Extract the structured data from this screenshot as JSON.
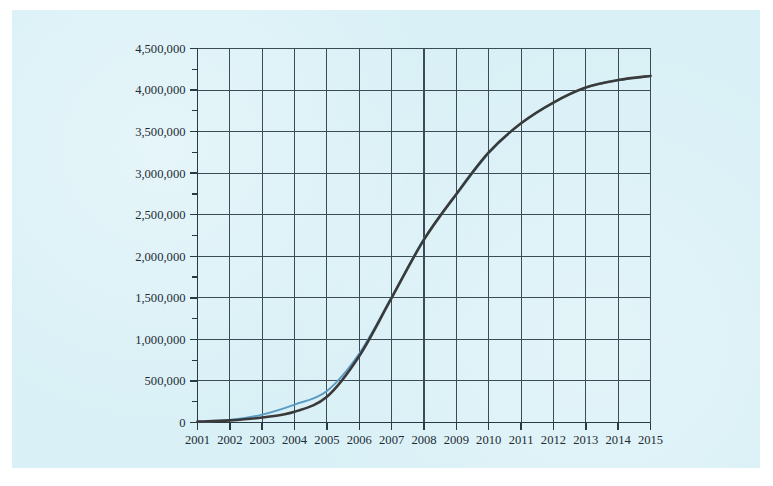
{
  "page": {
    "background_color": "#ffffff",
    "paper_tint_color": "#d8f0f6"
  },
  "chart_data": {
    "type": "line",
    "title": "",
    "subtitle": "",
    "xlabel": "",
    "ylabel": "",
    "xlim": [
      2001,
      2015
    ],
    "ylim": [
      0,
      4500000
    ],
    "grid": true,
    "legend_position": "none",
    "x_tick_labels": [
      "2001",
      "2002",
      "2003",
      "2004",
      "2005",
      "2006",
      "2007",
      "2008",
      "2009",
      "2010",
      "2011",
      "2012",
      "2013",
      "2014",
      "2015"
    ],
    "y_tick_labels": [
      "0",
      "500,000",
      "1,000,000",
      "1,500,000",
      "2,000,000",
      "2,500,000",
      "3,000,000",
      "3,500,000",
      "4,000,000",
      "4,500,000"
    ],
    "y_major_ticks": [
      0,
      500000,
      1000000,
      1500000,
      2000000,
      2500000,
      3000000,
      3500000,
      4000000,
      4500000
    ],
    "y_minor_ticks": [
      250000,
      750000,
      1250000,
      1750000,
      2250000,
      2750000,
      3250000,
      3750000,
      4250000
    ],
    "x": [
      2001,
      2002,
      2003,
      2004,
      2005,
      2006,
      2007,
      2008,
      2009,
      2010,
      2011,
      2012,
      2013,
      2014,
      2015
    ],
    "series": [
      {
        "name": "Modelled curve",
        "color": "#3a3a3a",
        "width": 2.6,
        "values": [
          10000,
          25000,
          60000,
          130000,
          310000,
          800000,
          1500000,
          2200000,
          2750000,
          3250000,
          3600000,
          3850000,
          4030000,
          4120000,
          4170000
        ]
      },
      {
        "name": "Observed curve",
        "color": "#5b9bc4",
        "width": 2.0,
        "values": [
          10000,
          30000,
          95000,
          215000,
          380000,
          830000,
          1510000,
          2210000,
          2740000,
          3240000,
          3600000,
          3850000,
          4030000,
          4120000,
          4170000
        ]
      }
    ],
    "axis_color": "#2a3a44",
    "grid_color": "#3c4c56"
  }
}
